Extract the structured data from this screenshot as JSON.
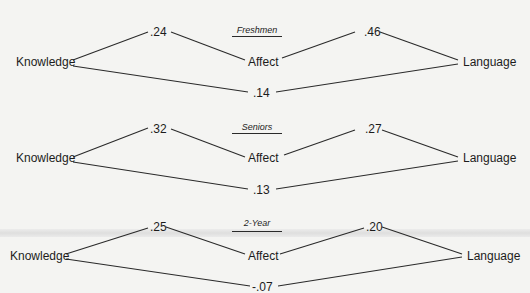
{
  "diagrams": [
    {
      "group": "Freshmen",
      "nodes": {
        "left": "Knowledge",
        "middle": "Affect",
        "right": "Language"
      },
      "coefficients": {
        "knowledge_affect": ".24",
        "affect_language": ".46",
        "knowledge_language": ".14"
      }
    },
    {
      "group": "Seniors",
      "nodes": {
        "left": "Knowledge",
        "middle": "Affect",
        "right": "Language"
      },
      "coefficients": {
        "knowledge_affect": ".32",
        "affect_language": ".27",
        "knowledge_language": ".13"
      }
    },
    {
      "group": "2-Year",
      "nodes": {
        "left": "Knowledge",
        "middle": "Affect",
        "right": "Language"
      },
      "coefficients": {
        "knowledge_affect": ".25",
        "affect_language": ".20",
        "knowledge_language": "-.07"
      }
    }
  ],
  "colors": {
    "background": "#f4f4f2",
    "ink": "#1c1c1c"
  }
}
